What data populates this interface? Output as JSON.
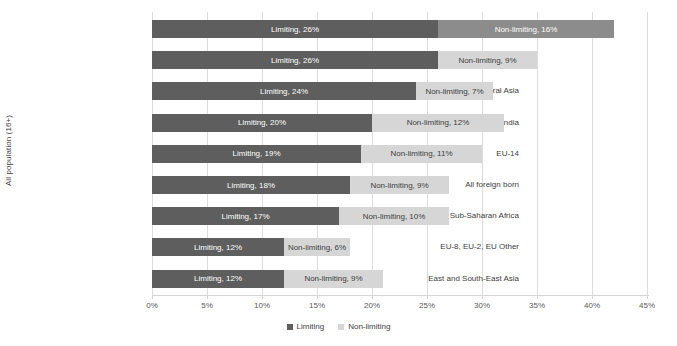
{
  "chart_data": {
    "type": "bar",
    "subtype": "stacked-horizontal",
    "title": "",
    "xlabel": "",
    "ylabel": "All population (16+)",
    "xlim": [
      0,
      45
    ],
    "xtick_labels": [
      "0%",
      "5%",
      "10%",
      "15%",
      "20%",
      "25%",
      "30%",
      "35%",
      "40%",
      "45%"
    ],
    "xtick_values": [
      0,
      5,
      10,
      15,
      20,
      25,
      30,
      35,
      40,
      45
    ],
    "grid": true,
    "legend_position": "bottom",
    "categories": [
      "UK",
      "Pakistan & other South Asian",
      "MENA & Central Asia",
      "India",
      "EU-14",
      "All foreign born",
      "Sub-Saharan Africa",
      "EU-8, EU-2, EU Other",
      "East and South-East Asia"
    ],
    "series": [
      {
        "name": "Limiting",
        "color": "#5e5e5e",
        "values": [
          26,
          26,
          24,
          20,
          19,
          18,
          17,
          12,
          12
        ],
        "labels": [
          "Limiting, 26%",
          "Limiting, 26%",
          "Limiting, 24%",
          "Limiting, 20%",
          "Limiting, 19%",
          "Limiting, 18%",
          "Limiting, 17%",
          "Limiting, 12%",
          "Limiting, 12%"
        ]
      },
      {
        "name": "Non-limiting",
        "color": "#d6d6d6",
        "values": [
          16,
          9,
          7,
          12,
          11,
          9,
          10,
          6,
          9
        ],
        "labels": [
          "Non-limiting, 16%",
          "Non-limiting, 9%",
          "Non-limiting, 7%",
          "Non-limiting, 12%",
          "Non-limiting, 11%",
          "Non-limiting, 9%",
          "Non-limiting, 10%",
          "Non-limiting, 6%",
          "Non-limiting, 9%"
        ]
      }
    ],
    "totals": [
      42,
      35,
      31,
      32,
      30,
      27,
      27,
      18,
      21
    ]
  },
  "legend": {
    "items": [
      {
        "label": "Limiting",
        "color": "#5e5e5e"
      },
      {
        "label": "Non-limiting",
        "color": "#d6d6d6"
      }
    ]
  }
}
